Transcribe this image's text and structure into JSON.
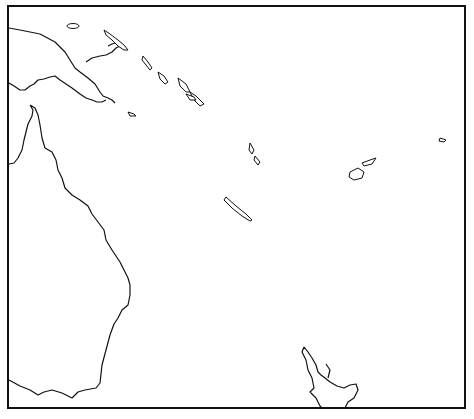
{
  "map": {
    "region": "Southwest Pacific",
    "frame": {
      "x": 8,
      "y": 6,
      "w": 457,
      "h": 402
    },
    "axes": {
      "longitude_ticks": [
        {
          "label": "150",
          "x": 100
        },
        {
          "label": "160",
          "x": 190
        },
        {
          "label": "170",
          "x": 283
        },
        {
          "label": "180",
          "x": 375
        }
      ],
      "latitude_ticks": [
        {
          "label": "5",
          "y": 54
        },
        {
          "label": "10",
          "y": 100
        },
        {
          "label": "15",
          "y": 146
        },
        {
          "label": "20",
          "y": 195
        },
        {
          "label": "25",
          "y": 245
        },
        {
          "label": "30",
          "y": 298
        },
        {
          "label": "35",
          "y": 353
        }
      ]
    },
    "symbols": {
      "large_square": {
        "color": "#111111",
        "description": "filled square"
      },
      "small_dot": {
        "color": "#111111",
        "description": "filled dot"
      },
      "open_circle": {
        "color": "#999999",
        "description": "open circle"
      },
      "vee": {
        "color": "#999999",
        "glyph": "v"
      },
      "plus": {
        "color": "#999999",
        "glyph": "+"
      }
    },
    "points": {
      "squares": [
        [
          108,
          28
        ],
        [
          104,
          36
        ],
        [
          110,
          42
        ],
        [
          138,
          33
        ],
        [
          131,
          47
        ],
        [
          136,
          53
        ],
        [
          159,
          67
        ],
        [
          174,
          65
        ],
        [
          160,
          72
        ],
        [
          165,
          72
        ],
        [
          154,
          83
        ],
        [
          167,
          79
        ],
        [
          164,
          92
        ],
        [
          172,
          92
        ],
        [
          181,
          98
        ],
        [
          226,
          115
        ],
        [
          233,
          118
        ],
        [
          226,
          128
        ],
        [
          240,
          130
        ],
        [
          258,
          138
        ],
        [
          262,
          128
        ],
        [
          260,
          132
        ],
        [
          264,
          135
        ],
        [
          266,
          140
        ],
        [
          268,
          150
        ],
        [
          266,
          158
        ],
        [
          278,
          155
        ],
        [
          270,
          170
        ],
        [
          272,
          174
        ],
        [
          283,
          170
        ],
        [
          292,
          178
        ],
        [
          290,
          183
        ],
        [
          296,
          185
        ],
        [
          300,
          190
        ],
        [
          294,
          192
        ],
        [
          254,
          180
        ],
        [
          256,
          186
        ],
        [
          272,
          188
        ],
        [
          280,
          195
        ],
        [
          283,
          200
        ],
        [
          286,
          206
        ],
        [
          290,
          210
        ],
        [
          292,
          212
        ],
        [
          270,
          206
        ],
        [
          302,
          215
        ],
        [
          290,
          220
        ],
        [
          279,
          230
        ],
        [
          289,
          232
        ],
        [
          298,
          228
        ],
        [
          315,
          218
        ],
        [
          322,
          210
        ],
        [
          354,
          196
        ],
        [
          362,
          194
        ],
        [
          368,
          188
        ],
        [
          374,
          180
        ],
        [
          380,
          175
        ],
        [
          378,
          170
        ],
        [
          385,
          192
        ],
        [
          370,
          200
        ],
        [
          373,
          202
        ],
        [
          380,
          196
        ],
        [
          388,
          201
        ],
        [
          384,
          212
        ],
        [
          365,
          235
        ],
        [
          388,
          220
        ],
        [
          349,
          234
        ],
        [
          350,
          256
        ],
        [
          335,
          257
        ],
        [
          347,
          258
        ],
        [
          362,
          260
        ],
        [
          336,
          271
        ],
        [
          344,
          275
        ],
        [
          340,
          283
        ],
        [
          345,
          280
        ],
        [
          330,
          222
        ],
        [
          328,
          232
        ],
        [
          343,
          227
        ],
        [
          373,
          225
        ],
        [
          378,
          232
        ],
        [
          386,
          240
        ],
        [
          394,
          245
        ],
        [
          419,
          173
        ],
        [
          435,
          151
        ],
        [
          293,
          308
        ],
        [
          303,
          320
        ],
        [
          304,
          320
        ],
        [
          317,
          327
        ],
        [
          401,
          367
        ],
        [
          427,
          278
        ],
        [
          434,
          293
        ],
        [
          452,
          286
        ],
        [
          454,
          294
        ],
        [
          421,
          306
        ],
        [
          422,
          325
        ],
        [
          422,
          320
        ],
        [
          146,
          293
        ],
        [
          161,
          316
        ]
      ],
      "dots": [
        [
          88,
          44
        ],
        [
          79,
          50
        ],
        [
          113,
          59
        ],
        [
          86,
          72
        ],
        [
          94,
          77
        ],
        [
          116,
          65
        ],
        [
          128,
          73
        ],
        [
          134,
          80
        ],
        [
          140,
          82
        ],
        [
          126,
          91
        ],
        [
          202,
          75
        ],
        [
          208,
          117
        ],
        [
          224,
          103
        ],
        [
          252,
          118
        ],
        [
          218,
          127
        ],
        [
          234,
          136
        ],
        [
          255,
          162
        ],
        [
          258,
          152
        ],
        [
          262,
          156
        ],
        [
          274,
          145
        ],
        [
          276,
          159
        ],
        [
          278,
          176
        ],
        [
          284,
          183
        ],
        [
          296,
          172
        ],
        [
          300,
          176
        ],
        [
          316,
          188
        ],
        [
          312,
          195
        ],
        [
          324,
          202
        ],
        [
          345,
          182
        ],
        [
          321,
          175
        ],
        [
          330,
          208
        ],
        [
          335,
          213
        ],
        [
          347,
          220
        ],
        [
          355,
          230
        ],
        [
          357,
          240
        ],
        [
          360,
          250
        ],
        [
          368,
          254
        ],
        [
          373,
          258
        ],
        [
          380,
          262
        ],
        [
          385,
          210
        ],
        [
          372,
          277
        ],
        [
          346,
          285
        ],
        [
          337,
          295
        ],
        [
          358,
          303
        ],
        [
          389,
          245
        ],
        [
          408,
          250
        ],
        [
          411,
          270
        ],
        [
          411,
          292
        ],
        [
          419,
          295
        ],
        [
          425,
          302
        ],
        [
          424,
          312
        ],
        [
          414,
          139
        ],
        [
          437,
          133
        ],
        [
          449,
          128
        ],
        [
          455,
          127
        ],
        [
          451,
          121
        ],
        [
          447,
          125
        ],
        [
          436,
          118
        ],
        [
          438,
          123
        ],
        [
          428,
          122
        ],
        [
          411,
          151
        ],
        [
          406,
          162
        ],
        [
          448,
          213
        ],
        [
          410,
          245
        ],
        [
          424,
          308
        ],
        [
          419,
          354
        ],
        [
          134,
          296
        ],
        [
          137,
          298
        ],
        [
          152,
          294
        ],
        [
          156,
          294
        ],
        [
          184,
          326
        ],
        [
          217,
          335
        ],
        [
          273,
          374
        ],
        [
          304,
          330
        ],
        [
          413,
          241
        ],
        [
          442,
          306
        ],
        [
          445,
          361
        ],
        [
          420,
          266
        ],
        [
          420,
          322
        ]
      ],
      "rings": [
        [
          153,
          101
        ],
        [
          204,
          101
        ],
        [
          183,
          124
        ],
        [
          293,
          91
        ],
        [
          271,
          101
        ],
        [
          351,
          87
        ],
        [
          358,
          96
        ],
        [
          286,
          194
        ],
        [
          278,
          190
        ],
        [
          283,
          209
        ],
        [
          270,
          183
        ],
        [
          297,
          188
        ],
        [
          316,
          165
        ],
        [
          327,
          162
        ],
        [
          337,
          160
        ],
        [
          345,
          170
        ],
        [
          372,
          185
        ],
        [
          385,
          181
        ],
        [
          391,
          182
        ],
        [
          405,
          133
        ],
        [
          409,
          118
        ],
        [
          412,
          112
        ],
        [
          414,
          110
        ],
        [
          420,
          120
        ],
        [
          423,
          122
        ],
        [
          425,
          118
        ],
        [
          430,
          161
        ],
        [
          428,
          178
        ],
        [
          442,
          145
        ],
        [
          401,
          265
        ],
        [
          403,
          233
        ],
        [
          295,
          245
        ],
        [
          300,
          235
        ],
        [
          311,
          239
        ],
        [
          310,
          250
        ],
        [
          322,
          238
        ],
        [
          318,
          247
        ],
        [
          326,
          279
        ],
        [
          333,
          275
        ],
        [
          337,
          282
        ],
        [
          324,
          287
        ],
        [
          326,
          296
        ],
        [
          328,
          290
        ],
        [
          296,
          243
        ],
        [
          290,
          255
        ],
        [
          287,
          246
        ],
        [
          298,
          260
        ],
        [
          207,
          335
        ],
        [
          214,
          332
        ],
        [
          234,
          335
        ],
        [
          230,
          340
        ],
        [
          241,
          335
        ],
        [
          248,
          335
        ],
        [
          272,
          340
        ],
        [
          232,
          344
        ],
        [
          371,
          342
        ],
        [
          316,
          224
        ],
        [
          300,
          210
        ],
        [
          307,
          220
        ],
        [
          360,
          154
        ],
        [
          366,
          163
        ],
        [
          376,
          152
        ],
        [
          380,
          157
        ],
        [
          390,
          154
        ],
        [
          395,
          164
        ]
      ],
      "vees": [
        [
          207,
          17
        ],
        [
          302,
          50
        ],
        [
          326,
          93
        ],
        [
          262,
          108
        ],
        [
          277,
          118
        ],
        [
          298,
          149
        ],
        [
          380,
          163
        ],
        [
          362,
          166
        ],
        [
          265,
          262
        ],
        [
          265,
          270
        ],
        [
          273,
          281
        ],
        [
          283,
          298
        ],
        [
          278,
          308
        ],
        [
          287,
          312
        ],
        [
          303,
          305
        ],
        [
          322,
          161
        ],
        [
          214,
          13
        ],
        [
          219,
          297
        ]
      ],
      "pluses": [
        [
          180,
          24
        ],
        [
          202,
          14
        ],
        [
          274,
          118
        ],
        [
          321,
          116
        ],
        [
          328,
          131
        ],
        [
          351,
          122
        ],
        [
          317,
          141
        ],
        [
          345,
          151
        ],
        [
          376,
          141
        ],
        [
          396,
          172
        ],
        [
          425,
          146
        ],
        [
          417,
          293
        ],
        [
          279,
          270
        ],
        [
          286,
          282
        ],
        [
          301,
          257
        ],
        [
          306,
          231
        ],
        [
          296,
          235
        ],
        [
          301,
          303
        ],
        [
          177,
          275
        ]
      ]
    }
  }
}
